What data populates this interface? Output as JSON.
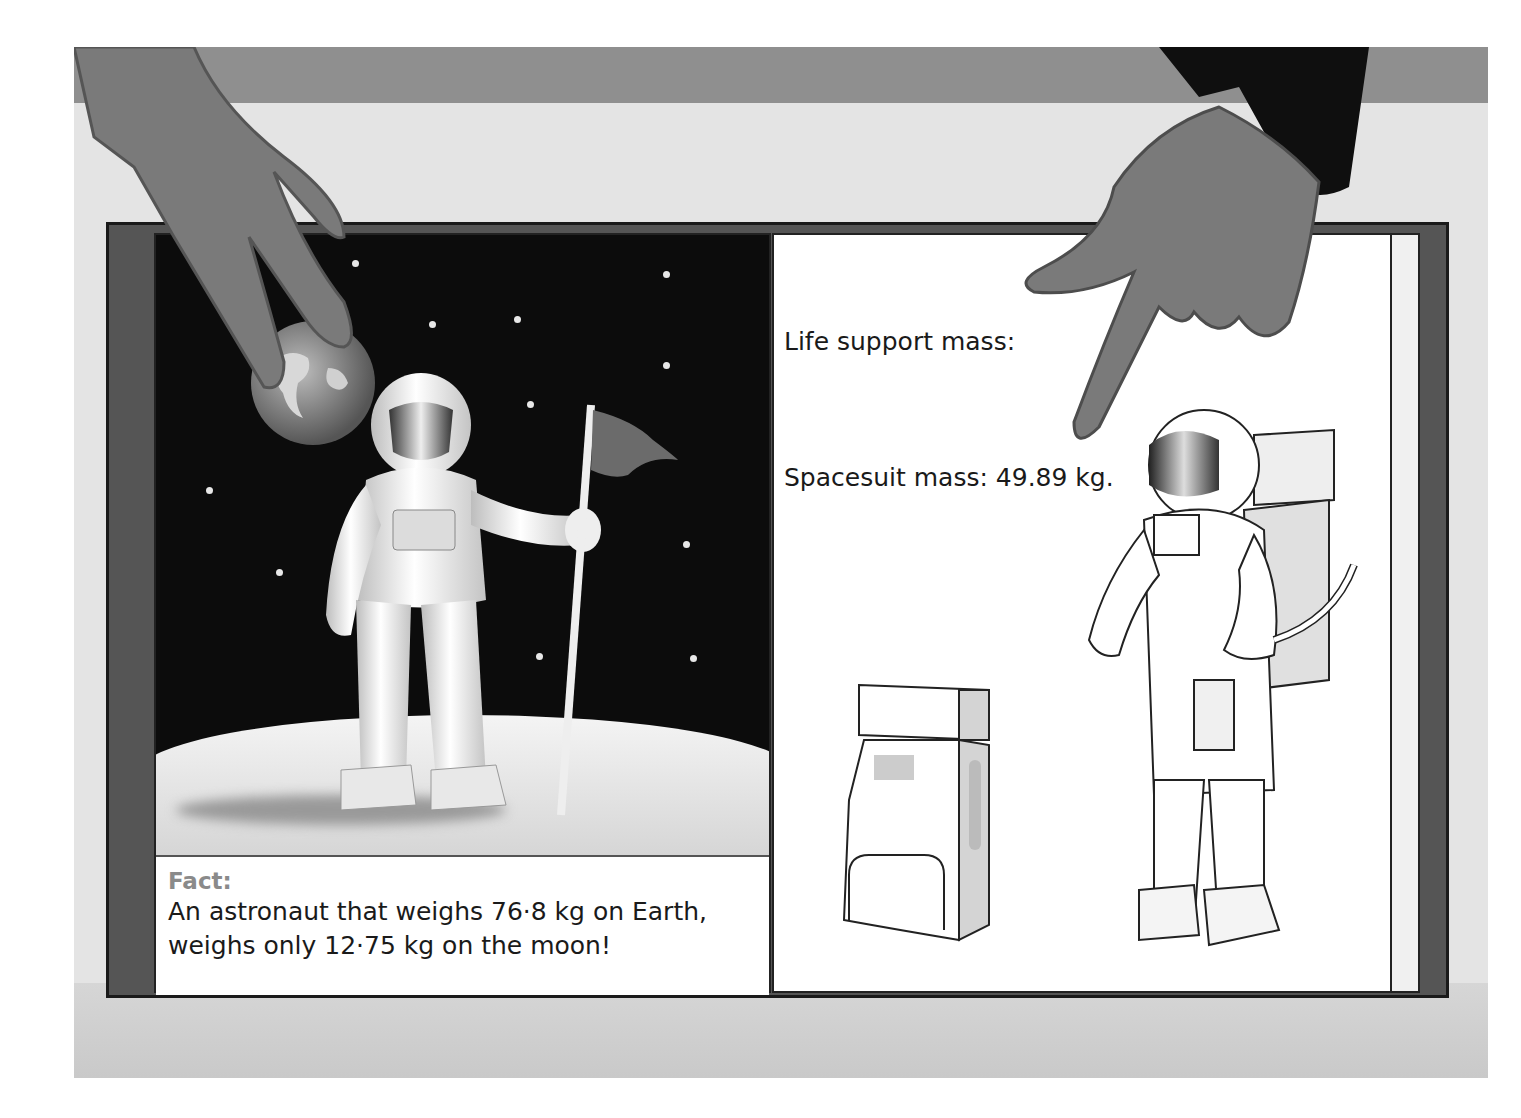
{
  "scene": {
    "description": "Two hands holding an open book showing astronaut illustrations",
    "colors": {
      "wall_top": "#8f8f8f",
      "wall": "#e4e4e4",
      "book_cover": "#555555",
      "space": "#0c0c0c",
      "hand": "#7a7a7a",
      "sleeve": "#0f0f0f",
      "fact_label": "#8a8a8a"
    }
  },
  "left_page": {
    "illustration": "Astronaut on the moon holding a flag with Earth in the sky",
    "fact": {
      "label": "Fact:",
      "line1": "An astronaut that weighs 76·8 kg on Earth,",
      "line2": "weighs only 12·75 kg on the moon!"
    }
  },
  "right_page": {
    "life_support_label": "Life support mass:",
    "spacesuit_label": "Spacesuit mass:  49.89 kg.",
    "illustration": "Line-drawn astronaut in spacesuit with backpack next to a life support unit"
  }
}
